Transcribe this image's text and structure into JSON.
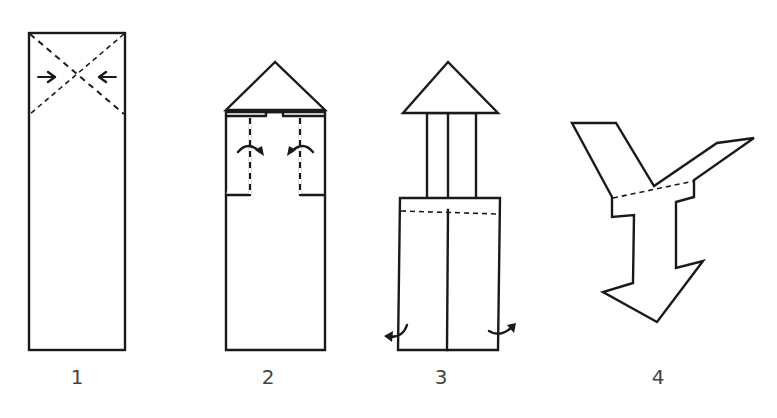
{
  "diagram": {
    "type": "folding-instructions",
    "steps": [
      {
        "number": "1",
        "description": "Rectangle with X crease (dashed) across top square; arrows point inward from both sides"
      },
      {
        "number": "2",
        "description": "Top folded into triangle point; side flaps folded inward along dashed lines (curved arrows)"
      },
      {
        "number": "3",
        "description": "Narrow neck under triangle; lower body with center seam and dashed horizontal fold; curved arrows at bottom corners pointing outward"
      },
      {
        "number": "4",
        "description": "Resulting Y-shaped figure with arrow-shaped bottom and dashed fold line"
      }
    ]
  },
  "labels": {
    "step1": "1",
    "step2": "2",
    "step3": "3",
    "step4": "4"
  },
  "colors": {
    "ink": "#1a1a1a",
    "label": "#444444",
    "background": "#ffffff"
  }
}
